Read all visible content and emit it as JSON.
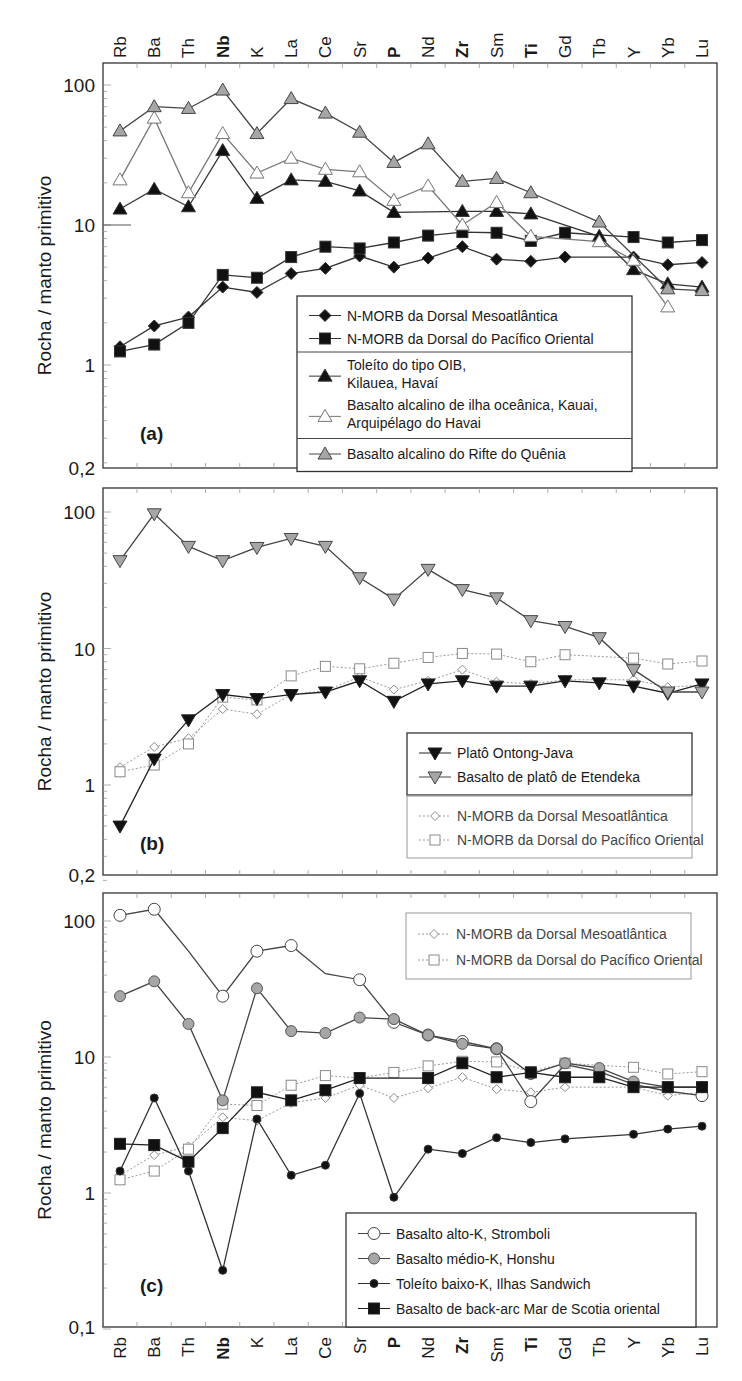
{
  "figure": {
    "elements": [
      "Rb",
      "Ba",
      "Th",
      "Nb",
      "K",
      "La",
      "Ce",
      "Sr",
      "P",
      "Nd",
      "Zr",
      "Sm",
      "Ti",
      "Gd",
      "Tb",
      "Y",
      "Yb",
      "Lu"
    ],
    "bold_elements": [
      "Nb",
      "P",
      "Zr",
      "Ti"
    ],
    "ylabel": "Rocha / manto primitivo",
    "colors": {
      "black": "#111111",
      "gray": "#a6a6a6",
      "white": "#ffffff",
      "line_gray": "#555555",
      "morb_ref": "#9a9a9a"
    }
  },
  "chart_data": [
    {
      "type": "line",
      "panel": "(a)",
      "title": "(a)",
      "xlabel": "",
      "ylabel": "Rocha / manto primitivo",
      "yscale": "log",
      "ylim": [
        0.2,
        150
      ],
      "yticks": [
        {
          "v": 100,
          "label": "100"
        },
        {
          "v": 10,
          "label": "10"
        },
        {
          "v": 1,
          "label": "1"
        },
        {
          "v": 0.2,
          "label": "0,2"
        }
      ],
      "categories": [
        "Rb",
        "Ba",
        "Th",
        "Nb",
        "K",
        "La",
        "Ce",
        "Sr",
        "P",
        "Nd",
        "Zr",
        "Sm",
        "Ti",
        "Gd",
        "Tb",
        "Y",
        "Yb",
        "Lu"
      ],
      "series": [
        {
          "name": "N-MORB da Dorsal Mesoatlântica",
          "marker": "diamond",
          "fill": "#111111",
          "line": "#333333",
          "dash": "",
          "values": [
            1.35,
            1.9,
            2.2,
            3.6,
            3.3,
            4.5,
            4.9,
            6.0,
            5.0,
            5.8,
            7.0,
            5.7,
            5.5,
            5.9,
            null,
            5.9,
            5.2,
            5.4
          ]
        },
        {
          "name": "N-MORB da Dorsal do Pacífico Oriental",
          "marker": "square",
          "fill": "#111111",
          "line": "#333333",
          "dash": "",
          "values": [
            1.25,
            1.4,
            2.0,
            4.4,
            4.2,
            5.9,
            7.0,
            6.8,
            7.5,
            8.4,
            8.9,
            8.8,
            7.7,
            8.8,
            null,
            8.2,
            7.5,
            7.8
          ]
        },
        {
          "name": "Toleíto do tipo OIB, Kilauea, Havaí",
          "marker": "triangle-up",
          "fill": "#111111",
          "line": "#333333",
          "dash": "",
          "values": [
            13,
            18,
            13.5,
            34,
            15.5,
            21,
            20.5,
            17.5,
            12.3,
            null,
            12.5,
            12.5,
            12,
            null,
            8.3,
            4.8,
            3.8,
            3.6
          ]
        },
        {
          "name": "Basalto alcalino de ilha oceânica, Kauai, Arquipélago do Havai",
          "marker": "triangle-up",
          "fill": "#ffffff",
          "line": "#777777",
          "dash": "",
          "values": [
            21,
            58,
            17,
            45,
            23.5,
            30,
            25,
            24,
            15,
            19,
            10,
            14.5,
            8.3,
            null,
            7.6,
            5.6,
            2.6,
            null
          ]
        },
        {
          "name": "Basalto alcalino do Rifte do Quênia",
          "marker": "triangle-up",
          "fill": "#a6a6a6",
          "line": "#444444",
          "dash": "",
          "values": [
            47,
            70,
            68,
            92,
            45,
            80,
            63,
            46,
            28,
            38,
            20.5,
            21.5,
            17,
            null,
            10.5,
            null,
            3.5,
            3.4
          ]
        }
      ],
      "legend": {
        "groups": [
          [
            {
              "label": "N-MORB da Dorsal Mesoatlântica",
              "series": 0
            },
            {
              "label": "N-MORB da Dorsal do Pacífico Oriental",
              "series": 1
            }
          ],
          [
            {
              "label": "Toleíto do tipo OIB,",
              "label2": "Kilauea, Havaí",
              "series": 2
            },
            {
              "label": "Basalto alcalino de ilha oceânica, Kauai,",
              "label2": "Arquipélago do Havai",
              "series": 3
            }
          ],
          [
            {
              "label": "Basalto alcalino do Rifte do Quênia",
              "series": 4
            }
          ]
        ]
      }
    },
    {
      "type": "line",
      "panel": "(b)",
      "title": "(b)",
      "xlabel": "",
      "ylabel": "Rocha / manto primitivo",
      "yscale": "log",
      "ylim": [
        0.2,
        150
      ],
      "yticks": [
        {
          "v": 100,
          "label": "100"
        },
        {
          "v": 10,
          "label": "10"
        },
        {
          "v": 1,
          "label": "1"
        },
        {
          "v": 0.2,
          "label": "0,2"
        }
      ],
      "categories": [
        "Rb",
        "Ba",
        "Th",
        "Nb",
        "K",
        "La",
        "Ce",
        "Sr",
        "P",
        "Nd",
        "Zr",
        "Sm",
        "Ti",
        "Gd",
        "Tb",
        "Y",
        "Yb",
        "Lu"
      ],
      "series": [
        {
          "name": "Platô Ontong-Java",
          "marker": "triangle-down",
          "fill": "#111111",
          "line": "#222222",
          "dash": "",
          "values": [
            0.5,
            1.55,
            3.0,
            4.6,
            4.3,
            4.6,
            4.8,
            5.8,
            4.1,
            5.5,
            5.8,
            5.3,
            5.3,
            5.8,
            5.6,
            5.3,
            4.7,
            5.5
          ]
        },
        {
          "name": "Basalto de platô de Etendeka",
          "marker": "triangle-down",
          "fill": "#a6a6a6",
          "line": "#444444",
          "dash": "",
          "values": [
            44,
            97,
            56,
            44,
            55,
            64,
            56,
            33,
            23,
            38,
            27,
            23.5,
            16,
            14.5,
            12,
            7,
            4.8,
            4.8
          ]
        },
        {
          "name": "N-MORB da Dorsal Mesoatlântica",
          "marker": "diamond-open",
          "fill": "#ffffff",
          "line": "#9a9a9a",
          "dash": "2,2",
          "values": [
            1.35,
            1.9,
            2.2,
            3.6,
            3.3,
            4.6,
            4.9,
            6.2,
            5.0,
            5.8,
            7.0,
            5.7,
            5.5,
            5.9,
            null,
            5.9,
            5.2,
            5.4
          ]
        },
        {
          "name": "N-MORB da Dorsal do Pacífico Oriental",
          "marker": "square-open",
          "fill": "#ffffff",
          "line": "#9a9a9a",
          "dash": "2,2",
          "values": [
            1.25,
            1.4,
            2.0,
            4.4,
            4.2,
            6.3,
            7.4,
            7.1,
            7.8,
            8.6,
            9.2,
            9.1,
            8.0,
            9.0,
            null,
            8.5,
            7.7,
            8.1
          ]
        }
      ],
      "legend": {
        "groups": [
          [
            {
              "label": "Platô Ontong-Java",
              "series": 0
            },
            {
              "label": "Basalto de platô de Etendeka",
              "series": 1
            }
          ],
          [
            {
              "label": "N-MORB da Dorsal Mesoatlântica",
              "series": 2
            },
            {
              "label": "N-MORB da Dorsal do Pacífico Oriental",
              "series": 3
            }
          ]
        ]
      }
    },
    {
      "type": "line",
      "panel": "(c)",
      "title": "(c)",
      "xlabel": "",
      "ylabel": "Rocha / manto primitivo",
      "yscale": "log",
      "ylim": [
        0.1,
        150
      ],
      "yticks": [
        {
          "v": 100,
          "label": "100"
        },
        {
          "v": 10,
          "label": "10"
        },
        {
          "v": 1,
          "label": "1"
        },
        {
          "v": 0.1,
          "label": "0,1"
        }
      ],
      "categories": [
        "Rb",
        "Ba",
        "Th",
        "Nb",
        "K",
        "La",
        "Ce",
        "Sr",
        "P",
        "Nd",
        "Zr",
        "Sm",
        "Ti",
        "Gd",
        "Tb",
        "Y",
        "Yb",
        "Lu"
      ],
      "series": [
        {
          "name": "Basalto alto-K, Stromboli",
          "marker": "circle-open",
          "fill": "#ffffff",
          "line": "#444444",
          "dash": "",
          "values": [
            110,
            122,
            null,
            28,
            60,
            66,
            null,
            37,
            18,
            14.5,
            13,
            11.5,
            4.7,
            null,
            null,
            6.3,
            null,
            5.2
          ],
          "markerless": [
            2,
            6,
            13,
            14,
            16,
            17
          ],
          "line_values": [
            110,
            122,
            60,
            28,
            60,
            66,
            41,
            37,
            18,
            14.5,
            13,
            11.5,
            4.7,
            8.8,
            7.8,
            6.3,
            5.6,
            5.2
          ]
        },
        {
          "name": "Basalto médio-K, Honshu",
          "marker": "circle",
          "fill": "#a6a6a6",
          "line": "#444444",
          "dash": "",
          "values": [
            28,
            36,
            17.5,
            4.8,
            32,
            15.5,
            15,
            19.5,
            19,
            14.5,
            12.5,
            11.5,
            7.5,
            9.0,
            8.3,
            6.6,
            6.0,
            6.0
          ]
        },
        {
          "name": "Toleíto baixo-K, Ilhas Sandwich",
          "marker": "circle-small",
          "fill": "#111111",
          "line": "#333333",
          "dash": "",
          "values": [
            1.45,
            5.0,
            1.45,
            0.27,
            3.5,
            1.35,
            1.6,
            5.4,
            0.93,
            2.1,
            1.95,
            2.55,
            2.35,
            2.5,
            null,
            2.7,
            2.95,
            3.1
          ]
        },
        {
          "name": "Basalto de back-arc Mar de Scotia oriental",
          "marker": "square",
          "fill": "#111111",
          "line": "#222222",
          "dash": "",
          "values": [
            2.3,
            2.25,
            1.7,
            3.0,
            5.5,
            4.8,
            5.7,
            7.0,
            null,
            7.0,
            9.0,
            7.1,
            7.7,
            7.1,
            7.1,
            6.0,
            6.0,
            6.0
          ]
        },
        {
          "name": "N-MORB da Dorsal Mesoatlântica",
          "marker": "diamond-open",
          "fill": "#ffffff",
          "line": "#9a9a9a",
          "dash": "2,2",
          "values": [
            1.35,
            1.9,
            2.2,
            3.6,
            3.4,
            4.6,
            5.0,
            6.2,
            5.0,
            5.9,
            7.1,
            5.8,
            5.5,
            6.0,
            null,
            6.0,
            5.2,
            5.5
          ]
        },
        {
          "name": "N-MORB da Dorsal do Pacífico Oriental",
          "marker": "square-open",
          "fill": "#ffffff",
          "line": "#9a9a9a",
          "dash": "2,2",
          "values": [
            1.25,
            1.45,
            2.1,
            4.5,
            4.4,
            6.2,
            7.3,
            7.0,
            7.7,
            8.6,
            9.3,
            9.2,
            7.8,
            9.0,
            null,
            8.4,
            7.5,
            7.8
          ]
        }
      ],
      "legend": {
        "top_groups": [
          [
            {
              "label": "N-MORB da Dorsal Mesoatlântica",
              "series": 4
            },
            {
              "label": "N-MORB da Dorsal do Pacífico Oriental",
              "series": 5
            }
          ]
        ],
        "bottom_groups": [
          [
            {
              "label": "Basalto alto-K, Stromboli",
              "series": 0
            },
            {
              "label": "Basalto médio-K, Honshu",
              "series": 1
            },
            {
              "label": "Toleíto baixo-K, Ilhas Sandwich",
              "series": 2
            },
            {
              "label": "Basalto de back-arc Mar de Scotia oriental",
              "series": 3
            }
          ]
        ]
      }
    }
  ]
}
